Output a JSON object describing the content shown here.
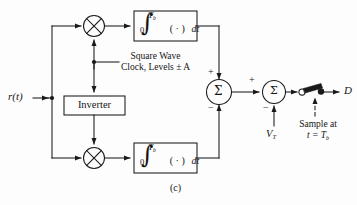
{
  "figure": {
    "caption": "(c)",
    "type": "block-diagram"
  },
  "colors": {
    "line": "#1a1a1a",
    "background": "#fdfdfd",
    "text": "#151515"
  },
  "signals": {
    "input_label": "r(t)",
    "output_label": "D",
    "threshold_label": "V",
    "threshold_sub": "T"
  },
  "blocks": {
    "integrator_top": {
      "integral_symbol": "∫",
      "upper_limit": "T",
      "upper_limit_sub": "b",
      "lower_limit": "0",
      "integrand": "( · )",
      "differential": "dt"
    },
    "integrator_bottom": {
      "integral_symbol": "∫",
      "upper_limit": "T",
      "upper_limit_sub": "b",
      "lower_limit": "0",
      "integrand": "( · )",
      "differential": "dt"
    },
    "inverter": {
      "label": "Inverter"
    },
    "multiplier_top": {
      "glyph": "⊗"
    },
    "multiplier_bottom": {
      "glyph": "⊗"
    },
    "summer_left": {
      "glyph": "Σ",
      "plus": "+",
      "minus": "−"
    },
    "summer_right": {
      "glyph": "Σ",
      "plus": "+",
      "minus": "−"
    }
  },
  "annotations": {
    "clock_line1": "Square Wave",
    "clock_line2": "Clock, Levels ± A",
    "sample_line1": "Sample at",
    "sample_line2_prefix": "t = T",
    "sample_line2_sub": "b"
  }
}
